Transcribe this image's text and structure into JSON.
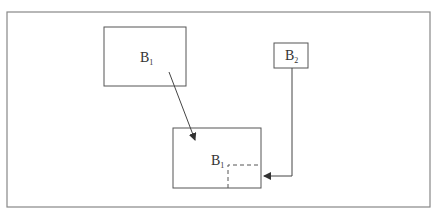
{
  "diagram": {
    "boxes": [
      {
        "id": "b1-source",
        "label": "B",
        "subscript": "1"
      },
      {
        "id": "b2-source",
        "label": "B",
        "subscript": "2"
      },
      {
        "id": "b1-target",
        "label": "B",
        "subscript": "1"
      }
    ],
    "edges": [
      {
        "from": "b1-source",
        "to": "b1-target",
        "style": "solid-arrow"
      },
      {
        "from": "b2-source",
        "to": "b1-target",
        "style": "elbow-arrow",
        "note": "points into dashed corner region"
      }
    ],
    "colors": {
      "stroke": "#555555",
      "text": "#333333",
      "frame": "#888888"
    }
  }
}
